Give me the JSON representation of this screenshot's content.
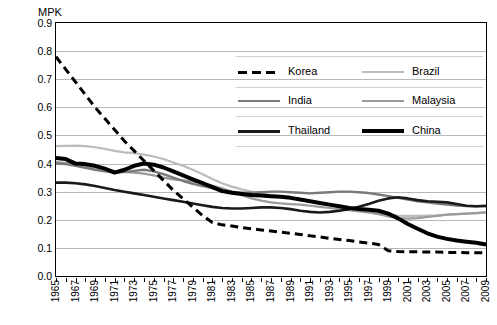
{
  "chart_data": {
    "type": "line",
    "title": "",
    "ylabel": "MPK",
    "xlabel": "",
    "ylim": [
      0.0,
      0.9
    ],
    "yticks": [
      "0.0",
      "0.1",
      "0.2",
      "0.3",
      "0.4",
      "0.5",
      "0.6",
      "0.7",
      "0.8",
      "0.9"
    ],
    "grid": true,
    "legend_position": "inside-top-right",
    "x": [
      1965,
      1966,
      1967,
      1968,
      1969,
      1970,
      1971,
      1972,
      1973,
      1974,
      1975,
      1976,
      1977,
      1978,
      1979,
      1980,
      1981,
      1982,
      1983,
      1984,
      1985,
      1986,
      1987,
      1988,
      1989,
      1990,
      1991,
      1992,
      1993,
      1994,
      1995,
      1996,
      1997,
      1998,
      1999,
      2000,
      2001,
      2002,
      2003,
      2004,
      2005,
      2006,
      2007,
      2008,
      2009
    ],
    "xtick_labels": [
      "1965",
      "1967",
      "1969",
      "1971",
      "1973",
      "1975",
      "1977",
      "1979",
      "1981",
      "1983",
      "1985",
      "1987",
      "1989",
      "1991",
      "1993",
      "1995",
      "1997",
      "1999",
      "2001",
      "2003",
      "2005",
      "2007",
      "2009"
    ],
    "series": [
      {
        "name": "Korea",
        "color": "#000000",
        "style": "dashed",
        "width": 3.0,
        "values": [
          0.78,
          0.735,
          0.69,
          0.645,
          0.6,
          0.56,
          0.52,
          0.48,
          0.445,
          0.41,
          0.375,
          0.34,
          0.305,
          0.275,
          0.245,
          0.215,
          0.19,
          0.182,
          0.178,
          0.172,
          0.168,
          0.164,
          0.16,
          0.156,
          0.152,
          0.148,
          0.143,
          0.139,
          0.134,
          0.13,
          0.126,
          0.121,
          0.117,
          0.112,
          0.09,
          0.087,
          0.086,
          0.086,
          0.085,
          0.085,
          0.084,
          0.084,
          0.083,
          0.083,
          0.082
        ]
      },
      {
        "name": "Brazil",
        "color": "#bcbcbc",
        "style": "solid",
        "width": 2.2,
        "values": [
          0.462,
          0.463,
          0.464,
          0.462,
          0.458,
          0.452,
          0.445,
          0.44,
          0.437,
          0.432,
          0.425,
          0.416,
          0.404,
          0.392,
          0.378,
          0.362,
          0.345,
          0.33,
          0.318,
          0.308,
          0.3,
          0.294,
          0.288,
          0.283,
          0.278,
          0.272,
          0.266,
          0.26,
          0.252,
          0.245,
          0.238,
          0.232,
          0.226,
          0.222,
          0.218,
          0.215,
          0.214,
          0.214,
          0.215,
          0.216,
          0.218,
          0.22,
          0.222,
          0.224,
          0.226
        ]
      },
      {
        "name": "India",
        "color": "#7a7a7a",
        "style": "solid",
        "width": 2.4,
        "values": [
          0.4,
          0.398,
          0.392,
          0.385,
          0.378,
          0.372,
          0.368,
          0.37,
          0.374,
          0.378,
          0.372,
          0.362,
          0.35,
          0.338,
          0.328,
          0.32,
          0.313,
          0.306,
          0.3,
          0.296,
          0.296,
          0.298,
          0.3,
          0.3,
          0.298,
          0.296,
          0.294,
          0.296,
          0.298,
          0.3,
          0.3,
          0.298,
          0.295,
          0.29,
          0.284,
          0.278,
          0.272,
          0.266,
          0.262,
          0.258,
          0.254,
          0.251,
          0.249,
          0.248,
          0.248
        ]
      },
      {
        "name": "Malaysia",
        "color": "#9a9a9a",
        "style": "solid",
        "width": 2.2,
        "values": [
          0.405,
          0.402,
          0.398,
          0.392,
          0.386,
          0.38,
          0.374,
          0.37,
          0.368,
          0.364,
          0.358,
          0.35,
          0.344,
          0.34,
          0.336,
          0.33,
          0.322,
          0.312,
          0.3,
          0.288,
          0.276,
          0.268,
          0.262,
          0.258,
          0.256,
          0.254,
          0.25,
          0.246,
          0.242,
          0.238,
          0.234,
          0.23,
          0.226,
          0.22,
          0.212,
          0.206,
          0.204,
          0.206,
          0.21,
          0.214,
          0.218,
          0.22,
          0.222,
          0.224,
          0.226
        ]
      },
      {
        "name": "Thailand",
        "color": "#1a1a1a",
        "style": "solid",
        "width": 2.6,
        "values": [
          0.332,
          0.332,
          0.33,
          0.326,
          0.32,
          0.313,
          0.306,
          0.3,
          0.294,
          0.288,
          0.282,
          0.276,
          0.27,
          0.264,
          0.258,
          0.252,
          0.246,
          0.242,
          0.24,
          0.24,
          0.242,
          0.244,
          0.244,
          0.242,
          0.238,
          0.232,
          0.228,
          0.226,
          0.228,
          0.232,
          0.238,
          0.246,
          0.256,
          0.268,
          0.276,
          0.28,
          0.276,
          0.27,
          0.266,
          0.264,
          0.262,
          0.256,
          0.25,
          0.248,
          0.25
        ]
      },
      {
        "name": "China",
        "color": "#000000",
        "style": "solid",
        "width": 4.0,
        "values": [
          0.42,
          0.416,
          0.4,
          0.398,
          0.392,
          0.382,
          0.368,
          0.378,
          0.392,
          0.4,
          0.396,
          0.386,
          0.372,
          0.358,
          0.344,
          0.33,
          0.316,
          0.302,
          0.296,
          0.292,
          0.288,
          0.286,
          0.284,
          0.282,
          0.278,
          0.272,
          0.266,
          0.26,
          0.254,
          0.248,
          0.242,
          0.238,
          0.236,
          0.232,
          0.222,
          0.205,
          0.185,
          0.168,
          0.152,
          0.14,
          0.132,
          0.126,
          0.122,
          0.118,
          0.112
        ]
      }
    ]
  },
  "legend": {
    "entries": [
      {
        "label": "Korea"
      },
      {
        "label": "Brazil"
      },
      {
        "label": "India"
      },
      {
        "label": "Malaysia"
      },
      {
        "label": "Thailand"
      },
      {
        "label": "China"
      }
    ]
  }
}
